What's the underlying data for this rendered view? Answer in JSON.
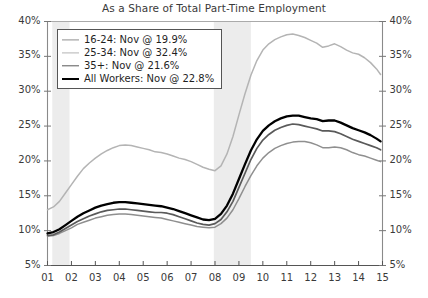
{
  "chart_data": {
    "type": "line",
    "title": "As a Share of Total Part-Time Employment",
    "subtitle": "",
    "xlabel": "",
    "ylabel": "",
    "ylim": [
      5,
      40
    ],
    "ytick_step": 5,
    "y_ticks": [
      "5%",
      "10%",
      "15%",
      "20%",
      "25%",
      "30%",
      "35%",
      "40%"
    ],
    "y_axis_left_label": "Percent",
    "y_axis_right_label": "Percent",
    "dual_axis": true,
    "grid": false,
    "legend_position": "upper-left",
    "x_ticks": [
      "01",
      "02",
      "03",
      "04",
      "05",
      "06",
      "07",
      "08",
      "09",
      "10",
      "11",
      "12",
      "13",
      "14",
      "15"
    ],
    "xlim": [
      2001,
      2015
    ],
    "recession_bands": [
      {
        "start": 2001.2,
        "end": 2001.92,
        "color": "#ececec"
      },
      {
        "start": 2007.95,
        "end": 2009.5,
        "color": "#ececec"
      }
    ],
    "series": [
      {
        "name": "16-24: Nov @ 19.9%",
        "short_name": "16-24",
        "last_value": 19.9,
        "last_period": "Nov",
        "color": "#8f8f8f",
        "width": 1.5,
        "x": [
          2001.0,
          2001.25,
          2001.5,
          2001.75,
          2002.0,
          2002.25,
          2002.5,
          2002.75,
          2003.0,
          2003.25,
          2003.5,
          2003.75,
          2004.0,
          2004.25,
          2004.5,
          2004.75,
          2005.0,
          2005.25,
          2005.5,
          2005.75,
          2006.0,
          2006.25,
          2006.5,
          2006.75,
          2007.0,
          2007.25,
          2007.5,
          2007.75,
          2008.0,
          2008.25,
          2008.5,
          2008.75,
          2009.0,
          2009.25,
          2009.5,
          2009.75,
          2010.0,
          2010.25,
          2010.5,
          2010.75,
          2011.0,
          2011.25,
          2011.5,
          2011.75,
          2012.0,
          2012.25,
          2012.5,
          2012.75,
          2013.0,
          2013.25,
          2013.5,
          2013.75,
          2014.0,
          2014.25,
          2014.5,
          2014.75,
          2014.92
        ],
        "values": [
          9.2,
          9.3,
          9.6,
          10.0,
          10.4,
          10.9,
          11.2,
          11.5,
          11.8,
          12.0,
          12.2,
          12.3,
          12.4,
          12.4,
          12.3,
          12.2,
          12.1,
          12.0,
          11.9,
          11.8,
          11.6,
          11.4,
          11.2,
          11.0,
          10.8,
          10.6,
          10.5,
          10.4,
          10.5,
          11.0,
          11.8,
          13.0,
          14.6,
          16.3,
          17.9,
          19.3,
          20.4,
          21.2,
          21.8,
          22.2,
          22.5,
          22.7,
          22.8,
          22.8,
          22.6,
          22.3,
          21.9,
          21.9,
          22.0,
          21.9,
          21.6,
          21.2,
          20.9,
          20.7,
          20.4,
          20.1,
          19.9
        ]
      },
      {
        "name": "25-34: Nov @ 32.4%",
        "short_name": "25-34",
        "last_value": 32.4,
        "last_period": "Nov",
        "color": "#b4b4b4",
        "width": 1.5,
        "x": [
          2001.0,
          2001.25,
          2001.5,
          2001.75,
          2002.0,
          2002.25,
          2002.5,
          2002.75,
          2003.0,
          2003.25,
          2003.5,
          2003.75,
          2004.0,
          2004.25,
          2004.5,
          2004.75,
          2005.0,
          2005.25,
          2005.5,
          2005.75,
          2006.0,
          2006.25,
          2006.5,
          2006.75,
          2007.0,
          2007.25,
          2007.5,
          2007.75,
          2008.0,
          2008.25,
          2008.5,
          2008.75,
          2009.0,
          2009.25,
          2009.5,
          2009.75,
          2010.0,
          2010.25,
          2010.5,
          2010.75,
          2011.0,
          2011.25,
          2011.5,
          2011.75,
          2012.0,
          2012.25,
          2012.5,
          2012.75,
          2013.0,
          2013.25,
          2013.5,
          2013.75,
          2014.0,
          2014.25,
          2014.5,
          2014.75,
          2014.92
        ],
        "values": [
          13.0,
          13.4,
          14.2,
          15.4,
          16.6,
          17.8,
          18.9,
          19.7,
          20.4,
          21.0,
          21.5,
          21.9,
          22.2,
          22.3,
          22.2,
          22.0,
          21.8,
          21.6,
          21.3,
          21.2,
          21.0,
          20.7,
          20.4,
          20.2,
          19.9,
          19.5,
          19.1,
          18.8,
          18.6,
          19.3,
          21.0,
          23.5,
          26.6,
          29.6,
          32.3,
          34.4,
          35.9,
          36.8,
          37.4,
          37.8,
          38.1,
          38.2,
          38.0,
          37.7,
          37.3,
          36.9,
          36.3,
          36.5,
          36.8,
          36.4,
          35.9,
          35.5,
          35.3,
          34.8,
          34.1,
          33.2,
          32.4
        ]
      },
      {
        "name": "35+: Nov @ 21.6%",
        "short_name": "35+",
        "last_value": 21.6,
        "last_period": "Nov",
        "color": "#5a5a5a",
        "width": 1.7,
        "x": [
          2001.0,
          2001.25,
          2001.5,
          2001.75,
          2002.0,
          2002.25,
          2002.5,
          2002.75,
          2003.0,
          2003.25,
          2003.5,
          2003.75,
          2004.0,
          2004.25,
          2004.5,
          2004.75,
          2005.0,
          2005.25,
          2005.5,
          2005.75,
          2006.0,
          2006.25,
          2006.5,
          2006.75,
          2007.0,
          2007.25,
          2007.5,
          2007.75,
          2008.0,
          2008.25,
          2008.5,
          2008.75,
          2009.0,
          2009.25,
          2009.5,
          2009.75,
          2010.0,
          2010.25,
          2010.5,
          2010.75,
          2011.0,
          2011.25,
          2011.5,
          2011.75,
          2012.0,
          2012.25,
          2012.5,
          2012.75,
          2013.0,
          2013.25,
          2013.5,
          2013.75,
          2014.0,
          2014.25,
          2014.5,
          2014.75,
          2014.92
        ],
        "values": [
          9.3,
          9.4,
          9.8,
          10.3,
          10.8,
          11.3,
          11.7,
          12.1,
          12.4,
          12.7,
          12.9,
          13.0,
          13.1,
          13.1,
          13.0,
          12.9,
          12.8,
          12.7,
          12.6,
          12.6,
          12.5,
          12.3,
          12.0,
          11.7,
          11.4,
          11.1,
          10.9,
          10.8,
          11.0,
          11.6,
          12.7,
          14.2,
          16.2,
          18.2,
          20.2,
          21.8,
          23.0,
          23.8,
          24.4,
          24.8,
          25.1,
          25.3,
          25.2,
          25.0,
          24.8,
          24.6,
          24.3,
          24.3,
          24.2,
          23.9,
          23.5,
          23.1,
          22.8,
          22.5,
          22.2,
          21.9,
          21.6
        ]
      },
      {
        "name": "All Workers: Nov @ 22.8%",
        "short_name": "All Workers",
        "last_value": 22.8,
        "last_period": "Nov",
        "color": "#000000",
        "width": 2.3,
        "x": [
          2001.0,
          2001.25,
          2001.5,
          2001.75,
          2002.0,
          2002.25,
          2002.5,
          2002.75,
          2003.0,
          2003.25,
          2003.5,
          2003.75,
          2004.0,
          2004.25,
          2004.5,
          2004.75,
          2005.0,
          2005.25,
          2005.5,
          2005.75,
          2006.0,
          2006.25,
          2006.5,
          2006.75,
          2007.0,
          2007.25,
          2007.5,
          2007.75,
          2008.0,
          2008.25,
          2008.5,
          2008.75,
          2009.0,
          2009.25,
          2009.5,
          2009.75,
          2010.0,
          2010.25,
          2010.5,
          2010.75,
          2011.0,
          2011.25,
          2011.5,
          2011.75,
          2012.0,
          2012.25,
          2012.5,
          2012.75,
          2013.0,
          2013.25,
          2013.5,
          2013.75,
          2014.0,
          2014.25,
          2014.5,
          2014.75,
          2014.92
        ],
        "values": [
          9.6,
          9.8,
          10.2,
          10.8,
          11.4,
          12.0,
          12.5,
          12.9,
          13.3,
          13.6,
          13.8,
          14.0,
          14.1,
          14.1,
          14.0,
          13.9,
          13.8,
          13.7,
          13.6,
          13.5,
          13.3,
          13.1,
          12.8,
          12.5,
          12.2,
          11.9,
          11.6,
          11.5,
          11.7,
          12.4,
          13.6,
          15.3,
          17.4,
          19.5,
          21.5,
          23.1,
          24.3,
          25.1,
          25.7,
          26.1,
          26.4,
          26.5,
          26.5,
          26.3,
          26.1,
          26.0,
          25.7,
          25.8,
          25.8,
          25.5,
          25.1,
          24.7,
          24.4,
          24.1,
          23.7,
          23.2,
          22.8
        ]
      }
    ]
  }
}
